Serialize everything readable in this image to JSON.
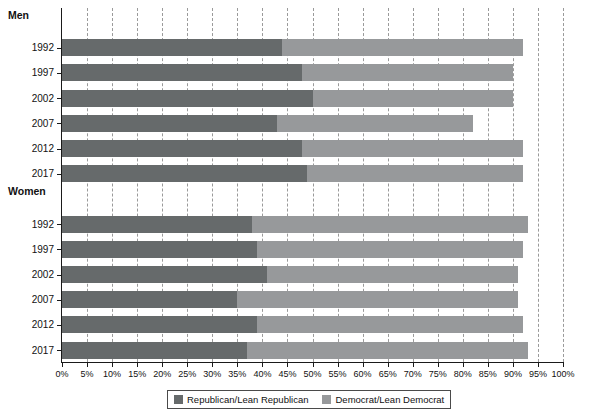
{
  "chart_data": {
    "type": "bar",
    "orientation": "horizontal",
    "stacked": true,
    "title": "",
    "subtitle": "",
    "xlabel": "",
    "ylabel": "",
    "xlim": [
      0,
      100
    ],
    "grid": true,
    "legend_position": "bottom",
    "tick_labels": [
      "0%",
      "5%",
      "10%",
      "15%",
      "20%",
      "25%",
      "30%",
      "35%",
      "40%",
      "45%",
      "50%",
      "55%",
      "60%",
      "65%",
      "70%",
      "75%",
      "80%",
      "85%",
      "90%",
      "95%",
      "100%"
    ],
    "tick_values": [
      0,
      5,
      10,
      15,
      20,
      25,
      30,
      35,
      40,
      45,
      50,
      55,
      60,
      65,
      70,
      75,
      80,
      85,
      90,
      95,
      100
    ],
    "legend": [
      {
        "label": "Republican/Lean Republican",
        "color": "#666a6b"
      },
      {
        "label": "Democrat/Lean Democrat",
        "color": "#97999b"
      }
    ],
    "series": [
      {
        "name": "Republican/Lean Republican",
        "color": "#666a6b"
      },
      {
        "name": "Democrat/Lean Democrat",
        "color": "#97999b"
      }
    ],
    "groups": [
      {
        "name": "Men",
        "rows": [
          {
            "category": "1992",
            "republican": 44,
            "democrat": 48,
            "total": 92
          },
          {
            "category": "1997",
            "republican": 48,
            "democrat": 42,
            "total": 90
          },
          {
            "category": "2002",
            "republican": 50,
            "democrat": 40,
            "total": 90
          },
          {
            "category": "2007",
            "republican": 43,
            "democrat": 39,
            "total": 82
          },
          {
            "category": "2012",
            "republican": 48,
            "democrat": 44,
            "total": 92
          },
          {
            "category": "2017",
            "republican": 49,
            "democrat": 43,
            "total": 92
          }
        ]
      },
      {
        "name": "Women",
        "rows": [
          {
            "category": "1992",
            "republican": 38,
            "democrat": 55,
            "total": 93
          },
          {
            "category": "1997",
            "republican": 39,
            "democrat": 53,
            "total": 92
          },
          {
            "category": "2002",
            "republican": 41,
            "democrat": 50,
            "total": 91
          },
          {
            "category": "2007",
            "republican": 35,
            "democrat": 56,
            "total": 91
          },
          {
            "category": "2012",
            "republican": 39,
            "democrat": 53,
            "total": 92
          },
          {
            "category": "2017",
            "republican": 37,
            "democrat": 56,
            "total": 93
          }
        ]
      }
    ]
  },
  "axis": {
    "x_tick_label_0": "0%",
    "x_tick_label_1": "5%",
    "x_tick_label_2": "10%",
    "x_tick_label_3": "15%",
    "x_tick_label_4": "20%",
    "x_tick_label_5": "25%",
    "x_tick_label_6": "30%",
    "x_tick_label_7": "35%",
    "x_tick_label_8": "40%",
    "x_tick_label_9": "45%",
    "x_tick_label_10": "50%",
    "x_tick_label_11": "55%",
    "x_tick_label_12": "60%",
    "x_tick_label_13": "65%",
    "x_tick_label_14": "70%",
    "x_tick_label_15": "75%",
    "x_tick_label_16": "80%",
    "x_tick_label_17": "85%",
    "x_tick_label_18": "90%",
    "x_tick_label_19": "95%",
    "x_tick_label_20": "100%"
  },
  "colors": {
    "republican": "#666a6b",
    "democrat": "#97999b",
    "axis": "#1a1a1a",
    "grid": "#9a9a9a",
    "background": "#ffffff"
  }
}
